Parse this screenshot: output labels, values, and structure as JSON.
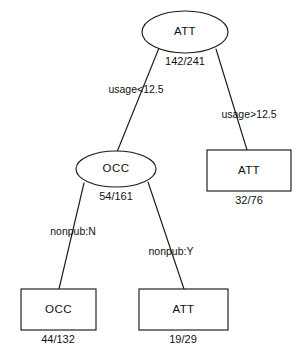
{
  "diagram": {
    "type": "decision-tree",
    "background_color": "#ffffff",
    "stroke_color": "#1a1a1a",
    "text_color": "#111111",
    "nodes": [
      {
        "id": "root",
        "shape": "ellipse",
        "label": "ATT",
        "stat": "142/241",
        "cx": 185,
        "cy": 32,
        "rx": 43,
        "ry": 21,
        "stat_x": 185,
        "stat_y": 62
      },
      {
        "id": "occ-internal",
        "shape": "ellipse",
        "label": "OCC",
        "stat": "54/161",
        "cx": 116,
        "cy": 169,
        "rx": 40,
        "ry": 18,
        "stat_x": 116,
        "stat_y": 197
      },
      {
        "id": "att-leaf-right",
        "shape": "rect",
        "label": "ATT",
        "stat": "32/76",
        "x": 207,
        "y": 150,
        "width": 84,
        "height": 41,
        "stat_x": 249,
        "stat_y": 201
      },
      {
        "id": "occ-leaf",
        "shape": "rect",
        "label": "OCC",
        "stat": "44/132",
        "x": 21,
        "y": 289,
        "width": 75,
        "height": 41,
        "stat_x": 58,
        "stat_y": 340
      },
      {
        "id": "att-leaf-bottom",
        "shape": "rect",
        "label": "ATT",
        "stat": "19/29",
        "x": 139,
        "y": 289,
        "width": 89,
        "height": 41,
        "stat_x": 183,
        "stat_y": 340
      }
    ],
    "edges": [
      {
        "id": "edge-usage-lt",
        "from": "root",
        "to": "occ-internal",
        "label": "usage<12.5",
        "x1": 159,
        "y1": 48,
        "x2": 117,
        "y2": 152,
        "label_x": 136,
        "label_y": 90
      },
      {
        "id": "edge-usage-gt",
        "from": "root",
        "to": "att-leaf-right",
        "label": "usage>12.5",
        "x1": 216,
        "y1": 49,
        "x2": 247,
        "y2": 150,
        "label_x": 249,
        "label_y": 115
      },
      {
        "id": "edge-nonpub-n",
        "from": "occ-internal",
        "to": "occ-leaf",
        "label": "nonpub:N",
        "x1": 84,
        "y1": 183,
        "x2": 59,
        "y2": 289,
        "label_x": 73,
        "label_y": 232
      },
      {
        "id": "edge-nonpub-y",
        "from": "occ-internal",
        "to": "att-leaf-bottom",
        "label": "nonpub:Y",
        "x1": 148,
        "y1": 182,
        "x2": 184,
        "y2": 289,
        "label_x": 171,
        "label_y": 252
      }
    ]
  }
}
